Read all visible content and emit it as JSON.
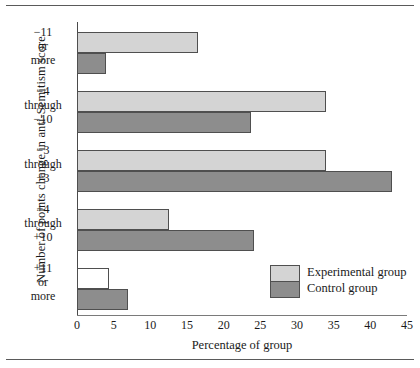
{
  "chart_data": {
    "type": "bar",
    "orientation": "horizontal",
    "title": "",
    "xlabel": "Percentage of group",
    "ylabel": "Number of points change in anti-Semitism score",
    "xlim": [
      0,
      45
    ],
    "xticks": [
      0,
      5,
      10,
      15,
      20,
      25,
      30,
      35,
      40,
      45
    ],
    "grid": false,
    "legend_position": "inside-bottom-right",
    "categories": [
      "−11\nor\nmore",
      "−4\nthrough\n−10",
      "−3\nthrough\n+3",
      "+4\nthrough\n+10",
      "+11\nor\nmore"
    ],
    "category_lines": [
      [
        "−11",
        "or",
        "more"
      ],
      [
        "−4",
        "through",
        "−10"
      ],
      [
        "−3",
        "through",
        "+3"
      ],
      [
        "+4",
        "through",
        "+10"
      ],
      [
        "+11",
        "or",
        "more"
      ]
    ],
    "series": [
      {
        "name": "Experimental group",
        "color": "#d4d4d4",
        "values": [
          16.5,
          34,
          34,
          12.5,
          4.3
        ]
      },
      {
        "name": "Control group",
        "color": "#8d8d8d",
        "values": [
          3.9,
          23.7,
          43,
          24.2,
          6.9
        ]
      }
    ],
    "bar_fill_overrides": [
      {
        "series": 0,
        "category": 4,
        "color": "#ffffff"
      }
    ]
  },
  "legend": {
    "entries": [
      {
        "label": "Experimental group",
        "color": "#d4d4d4"
      },
      {
        "label": "Control group",
        "color": "#8d8d8d"
      }
    ]
  },
  "colors": {
    "experimental": "#d4d4d4",
    "control": "#8d8d8d",
    "outline": "#4f4f4f",
    "axis": "#4a4a4a",
    "rule": "#5a5a5a",
    "text": "#1a1a1a",
    "unfilled": "#ffffff"
  }
}
